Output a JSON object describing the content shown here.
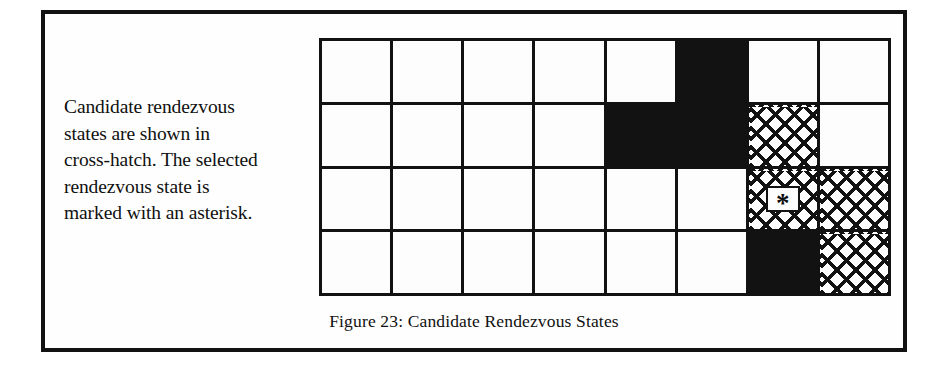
{
  "figure": {
    "caption": "Figure 23: Candidate Rendezvous States",
    "legend_lines": [
      "Candidate rendezvous",
      "states are shown in",
      "cross-hatch. The selected",
      "rendezvous state is",
      "marked with an asterisk."
    ],
    "legend_full_text": "Candidate rendezvous states are shown in cross-hatch. The selected rendezvous state is marked with an asterisk.",
    "marker_symbol": "*",
    "colors": {
      "ink": "#121212",
      "paper": "#fdfdfd"
    }
  },
  "grid": {
    "columns": 8,
    "rows": 4,
    "legend": {
      "empty": "free state",
      "filled": "obstacle / blocked state",
      "hatch": "candidate rendezvous state",
      "selected": "selected rendezvous state (asterisk)"
    },
    "cells": [
      [
        "empty",
        "empty",
        "empty",
        "empty",
        "empty",
        "filled",
        "empty",
        "empty"
      ],
      [
        "empty",
        "empty",
        "empty",
        "empty",
        "filled",
        "filled",
        "hatch",
        "empty"
      ],
      [
        "empty",
        "empty",
        "empty",
        "empty",
        "empty",
        "empty",
        "selected",
        "hatch"
      ],
      [
        "empty",
        "empty",
        "empty",
        "empty",
        "empty",
        "empty",
        "filled",
        "hatch"
      ]
    ]
  }
}
